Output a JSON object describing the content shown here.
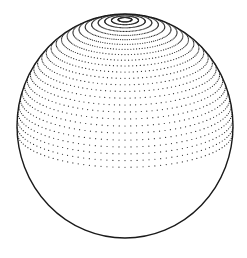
{
  "figure": {
    "background": "#ffffff",
    "stroke_color": "#1a1a1a",
    "dot_color": "#2a2a2a",
    "outline": {
      "cx": 125,
      "cy": 126,
      "rx": 108,
      "ry": 112,
      "stroke_width": 1.4
    },
    "projection": {
      "tilt_deg": 18,
      "ring_step_deg": 3.6,
      "ring_count": 26,
      "dots_per_ring": 112,
      "dot_radius": 0.6
    }
  }
}
